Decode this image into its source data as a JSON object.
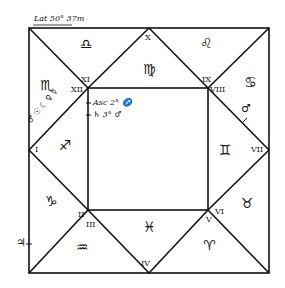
{
  "chart": {
    "latitude_label": "Lat 50° 37m",
    "ascendant_note": "Asc 2° ♐",
    "saturn_note": "♄ 3° ♂",
    "left_edge_mark": "♃",
    "houses": [
      {
        "id": "I",
        "label": "I"
      },
      {
        "id": "II",
        "label": "II"
      },
      {
        "id": "III",
        "label": "III"
      },
      {
        "id": "IV",
        "label": "IV"
      },
      {
        "id": "V",
        "label": "V"
      },
      {
        "id": "VI",
        "label": "VI"
      },
      {
        "id": "VII",
        "label": "VII"
      },
      {
        "id": "VIII",
        "label": "VIII"
      },
      {
        "id": "IX",
        "label": "IX"
      },
      {
        "id": "X",
        "label": "X"
      },
      {
        "id": "XI",
        "label": "XI"
      },
      {
        "id": "XII",
        "label": "XII"
      }
    ],
    "signs": {
      "libra": "♎",
      "virgo": "♍",
      "leo": "♌",
      "scorpio": "♏",
      "cancer": "♋",
      "sagittarius": "♐",
      "gemini": "♊",
      "capricorn": "♑",
      "taurus": "♉",
      "aquarius": "♒",
      "pisces": "♓",
      "aries": "♈"
    },
    "planets_cusp_xii": "♂ ☉ ☾ ♀ ☿",
    "mars_cusp_viii": "♂"
  }
}
